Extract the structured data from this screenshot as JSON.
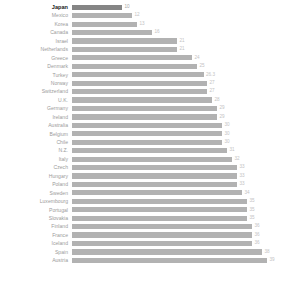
{
  "chart_data": {
    "type": "bar",
    "orientation": "horizontal",
    "title": "",
    "subtitle": "",
    "xlabel": "",
    "ylabel": "",
    "xlim": [
      0,
      40
    ],
    "grid": false,
    "legend": null,
    "highlight_category": "Japan",
    "colors": {
      "bar": "#b2b2b2",
      "bar_highlight": "#858585",
      "label": "#9b9b9b",
      "label_highlight": "#1a1a1a",
      "value": "#c3c3c3",
      "background": "#ffffff"
    },
    "categories": [
      "Japan",
      "Mexico",
      "Korea",
      "Canada",
      "Israel",
      "Netherlands",
      "Greece",
      "Denmark",
      "Turkey",
      "Norway",
      "Switzerland",
      "U.K.",
      "Germany",
      "Ireland",
      "Australia",
      "Belgium",
      "Chile",
      "N.Z.",
      "Italy",
      "Czech",
      "Hungary",
      "Poland",
      "Sweden",
      "Luxembourg",
      "Portugal",
      "Slovakia",
      "Finland",
      "France",
      "Iceland",
      "Spain",
      "Austria"
    ],
    "values": [
      10,
      12,
      13,
      16,
      21,
      21,
      24,
      25,
      26.3,
      27,
      27,
      28,
      29,
      29,
      30,
      30,
      30,
      31,
      32,
      33,
      33,
      33,
      34,
      35,
      35,
      35,
      36,
      36,
      36,
      38,
      39
    ],
    "value_labels": [
      "10",
      "12",
      "13",
      "16",
      "21",
      "21",
      "24",
      "25",
      "26.3",
      "27",
      "27",
      "28",
      "29",
      "29",
      "30",
      "30",
      "30",
      "31",
      "32",
      "33",
      "33",
      "33",
      "34",
      "35",
      "35",
      "35",
      "36",
      "36",
      "36",
      "38",
      "39"
    ]
  }
}
